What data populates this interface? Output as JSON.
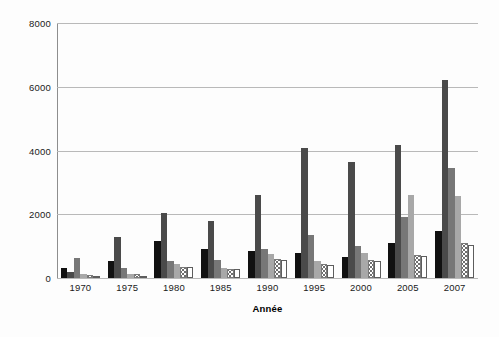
{
  "chart_data": {
    "type": "bar",
    "title": "",
    "subtitle": "",
    "xlabel": "Année",
    "ylabel": "",
    "categories": [
      "1970",
      "1975",
      "1980",
      "1985",
      "1990",
      "1995",
      "2000",
      "2005",
      "2007"
    ],
    "ylim": [
      0,
      8000
    ],
    "yticks": [
      0,
      2000,
      4000,
      6000,
      8000
    ],
    "ytick_labels": [
      "0",
      "2000",
      "4000",
      "6000",
      "8000"
    ],
    "grid": "horizontal",
    "legend": "none",
    "series": [
      {
        "name": "series-1",
        "style": "solid-black",
        "color": "#111111",
        "values": [
          300,
          540,
          1150,
          900,
          850,
          800,
          660,
          1100,
          1480
        ]
      },
      {
        "name": "series-2",
        "style": "solid-dark-gray",
        "color": "#4a4a4a",
        "values": [
          180,
          1280,
          2030,
          1790,
          2600,
          4070,
          3640,
          4180,
          6200
        ]
      },
      {
        "name": "series-3",
        "style": "solid-medium-gray",
        "color": "#777777",
        "values": [
          640,
          300,
          530,
          560,
          900,
          1340,
          1000,
          1900,
          3450
        ]
      },
      {
        "name": "series-4",
        "style": "solid-light-gray",
        "color": "#a8a8a8",
        "values": [
          140,
          120,
          450,
          320,
          750,
          520,
          790,
          2600,
          2560
        ]
      },
      {
        "name": "series-5",
        "style": "dotted-fill",
        "color": "#ffffff",
        "values": [
          90,
          140,
          340,
          290,
          600,
          430,
          560,
          720,
          1100
        ]
      },
      {
        "name": "series-6",
        "style": "white-outline",
        "color": "#ffffff",
        "values": [
          40,
          60,
          330,
          280,
          580,
          420,
          530,
          700,
          1050
        ]
      }
    ]
  }
}
